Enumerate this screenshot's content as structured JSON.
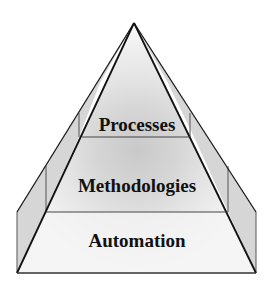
{
  "diagram": {
    "type": "pyramid",
    "layers": [
      {
        "label": "Processes",
        "level": "top"
      },
      {
        "label": "Methodologies",
        "level": "middle"
      },
      {
        "label": "Automation",
        "level": "bottom"
      }
    ],
    "colors": {
      "outline": "#1a1a1a",
      "side_panel": "#d4d4d4",
      "face_light": "#f2f2f2",
      "glow_mid": "#e0e0e0",
      "glow_core": "#cfcfcf",
      "background": "#ffffff"
    }
  }
}
